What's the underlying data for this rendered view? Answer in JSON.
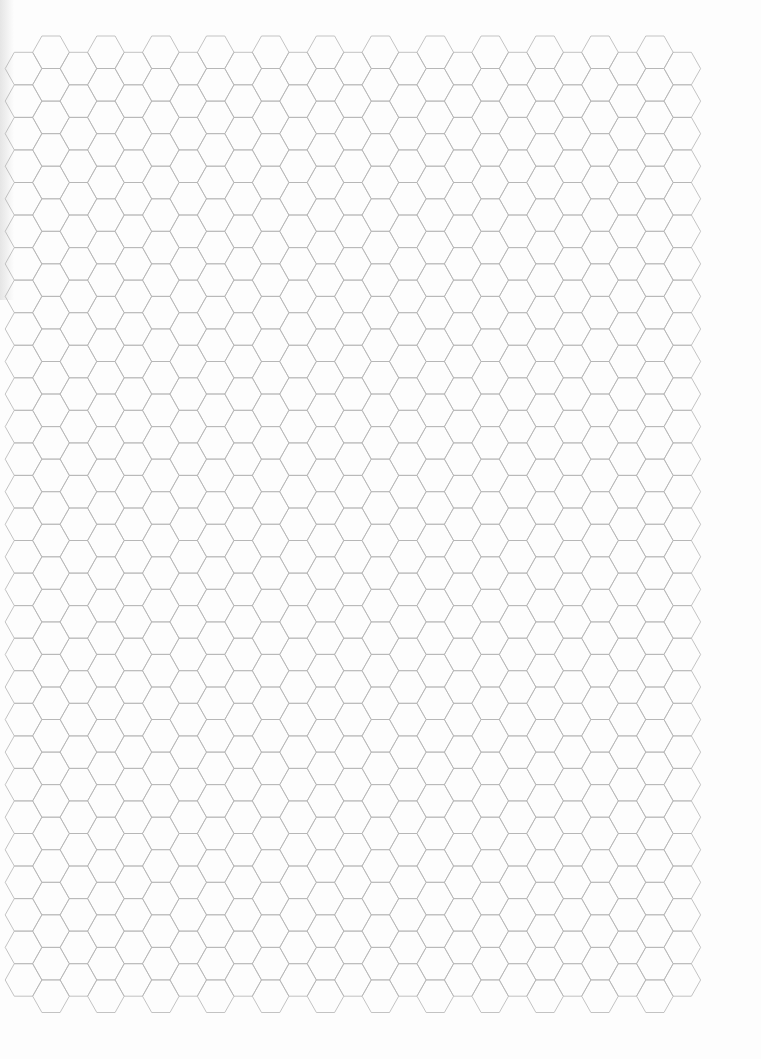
{
  "page": {
    "kind": "hexagonal graph paper",
    "background": "#fdfdfd",
    "line_color": "#b4b4b4"
  },
  "hex_grid": {
    "orientation": "flat-top",
    "radius": 18.3,
    "row_height": 32.55,
    "column_sets": [
      {
        "name": "upper",
        "first_center_x": 51,
        "top_y": 36,
        "pitch_x": 54.9,
        "columns": 12,
        "rows": 30
      },
      {
        "name": "offset",
        "first_center_x": 23.5,
        "top_y": 52.3,
        "pitch_x": 54.9,
        "columns": 13,
        "rows": 29
      }
    ]
  }
}
